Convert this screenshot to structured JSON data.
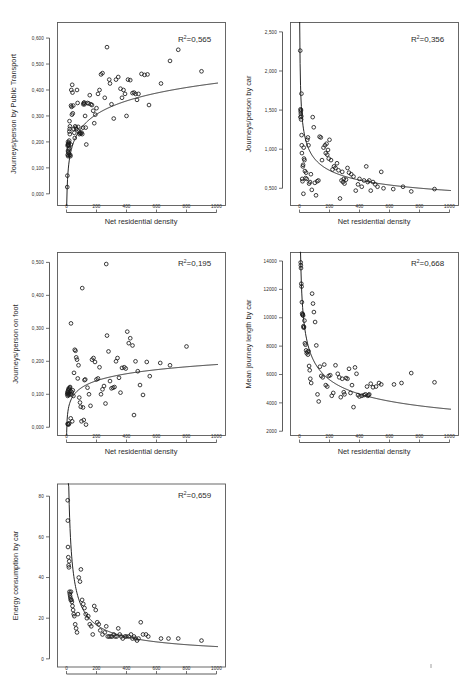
{
  "figure": {
    "background": "#ffffff",
    "marker_color": "#1a1a1a",
    "line_color": "#1a1a1a",
    "frame_color": "#585858",
    "shared_xlabel": "Net residential density",
    "shared_xticks": [
      "0",
      "200",
      "400",
      "600",
      "800",
      "1000"
    ],
    "r2_prefix": "R",
    "r2_sup": "2",
    "panel_count": 5
  },
  "chart_data": [
    {
      "id": "public-transport",
      "type": "scatter",
      "title": "",
      "xlabel": "Net residential density",
      "ylabel": "Journeys/person by Public Transport",
      "annotation": "R2=0,565",
      "r2_value": "=0,565",
      "xlim": [
        -60,
        1060
      ],
      "ylim": [
        -0.045,
        0.66
      ],
      "xticks": [
        0,
        200,
        400,
        600,
        800,
        1000
      ],
      "xticklabels": [
        "0",
        "200",
        "400",
        "600",
        "800",
        "1000"
      ],
      "yticks": [
        0.0,
        0.1,
        0.2,
        0.3,
        0.4,
        0.5,
        0.6
      ],
      "yticklabels": [
        "0,000",
        "0,100",
        "0,200",
        "0,300",
        "0,400",
        "0,500",
        "0,600"
      ],
      "grid": false,
      "fit": {
        "form": "logarithmic",
        "a": 0.0745,
        "b": -0.0885,
        "note": "y = a*ln(x) + b"
      },
      "x": [
        5,
        6,
        8,
        8,
        9,
        10,
        10,
        11,
        12,
        12,
        13,
        14,
        15,
        15,
        16,
        17,
        18,
        18,
        19,
        20,
        21,
        22,
        23,
        25,
        26,
        28,
        30,
        32,
        34,
        36,
        38,
        40,
        42,
        45,
        48,
        52,
        55,
        58,
        62,
        66,
        70,
        74,
        78,
        82,
        86,
        90,
        95,
        100,
        105,
        110,
        112,
        115,
        118,
        120,
        124,
        128,
        132,
        140,
        148,
        155,
        162,
        170,
        178,
        185,
        192,
        200,
        210,
        220,
        230,
        240,
        255,
        270,
        285,
        290,
        300,
        315,
        330,
        345,
        360,
        370,
        380,
        390,
        400,
        410,
        425,
        440,
        450,
        460,
        470,
        480,
        500,
        520,
        540,
        550,
        630,
        690,
        745,
        900
      ],
      "y": [
        0.026,
        0.07,
        0.185,
        0.15,
        0.19,
        0.165,
        0.2,
        0.145,
        0.188,
        0.16,
        0.192,
        0.17,
        0.186,
        0.155,
        0.196,
        0.175,
        0.205,
        0.148,
        0.24,
        0.28,
        0.25,
        0.23,
        0.26,
        0.15,
        0.145,
        0.19,
        0.34,
        0.4,
        0.335,
        0.305,
        0.42,
        0.39,
        0.31,
        0.34,
        0.25,
        0.235,
        0.215,
        0.26,
        0.255,
        0.25,
        0.4,
        0.35,
        0.258,
        0.24,
        0.23,
        0.235,
        0.232,
        0.236,
        0.23,
        0.255,
        0.345,
        0.35,
        0.352,
        0.345,
        0.3,
        0.255,
        0.19,
        0.35,
        0.348,
        0.38,
        0.345,
        0.342,
        0.32,
        0.272,
        0.305,
        0.33,
        0.385,
        0.4,
        0.46,
        0.465,
        0.37,
        0.565,
        0.44,
        0.425,
        0.345,
        0.29,
        0.44,
        0.45,
        0.405,
        0.37,
        0.4,
        0.385,
        0.3,
        0.44,
        0.438,
        0.388,
        0.39,
        0.385,
        0.362,
        0.385,
        0.462,
        0.458,
        0.46,
        0.342,
        0.425,
        0.512,
        0.555,
        0.472
      ]
    },
    {
      "id": "car-journeys",
      "type": "scatter",
      "title": "",
      "xlabel": "Net residential density",
      "ylabel": "Journeys/person by car",
      "annotation": "R2=0,356",
      "r2_value": "=0,356",
      "xlim": [
        -60,
        1060
      ],
      "ylim": [
        0.28,
        2.62
      ],
      "xticks": [
        0,
        200,
        400,
        600,
        800,
        1000
      ],
      "xticklabels": [
        "0",
        "200",
        "400",
        "600",
        "800",
        "1000"
      ],
      "yticks": [
        0.5,
        1.0,
        1.5,
        2.0,
        2.5
      ],
      "yticklabels": [
        "0,500",
        "1,000",
        "1,500",
        "2,000",
        "2,500"
      ],
      "grid": false,
      "fit": {
        "form": "power",
        "a": 3.05,
        "b": -0.27,
        "note": "y = a*x^b"
      },
      "x": [
        5,
        6,
        7,
        8,
        9,
        10,
        11,
        12,
        13,
        14,
        15,
        16,
        18,
        20,
        22,
        24,
        26,
        28,
        30,
        33,
        36,
        40,
        44,
        48,
        52,
        56,
        60,
        64,
        70,
        76,
        82,
        88,
        95,
        102,
        110,
        118,
        126,
        134,
        142,
        150,
        160,
        170,
        175,
        180,
        185,
        190,
        195,
        200,
        210,
        220,
        230,
        240,
        250,
        260,
        270,
        280,
        285,
        290,
        295,
        300,
        310,
        320,
        330,
        345,
        360,
        375,
        390,
        400,
        415,
        430,
        445,
        455,
        465,
        475,
        490,
        505,
        520,
        545,
        560,
        625,
        690,
        745,
        900
      ],
      "y": [
        2.26,
        1.41,
        1.51,
        1.48,
        1.45,
        1.5,
        1.38,
        1.42,
        1.71,
        1.18,
        1.05,
        0.95,
        0.62,
        0.59,
        0.78,
        0.8,
        0.43,
        1.02,
        0.88,
        0.86,
        0.72,
        0.63,
        0.7,
        0.62,
        1.12,
        1.15,
        1.05,
        0.56,
        0.58,
        0.68,
        0.48,
        1.41,
        1.28,
        0.57,
        0.41,
        0.59,
        0.6,
        1.16,
        1.15,
        0.86,
        1.02,
        1.05,
        0.95,
        1.07,
        0.93,
        0.99,
        0.88,
        1.12,
        0.86,
        0.74,
        0.78,
        0.76,
        0.82,
        0.73,
        0.37,
        0.6,
        0.71,
        0.58,
        0.62,
        0.56,
        0.61,
        0.76,
        0.7,
        0.68,
        0.65,
        0.47,
        0.55,
        0.62,
        0.52,
        0.6,
        0.78,
        0.58,
        0.6,
        0.47,
        0.58,
        0.55,
        0.52,
        0.71,
        0.5,
        0.49,
        0.52,
        0.46,
        0.49
      ]
    },
    {
      "id": "on-foot",
      "type": "scatter",
      "title": "",
      "xlabel": "Net residential density",
      "ylabel": "Journeys/person on foot",
      "annotation": "R2=0,195",
      "r2_value": "=0,195",
      "xlim": [
        -60,
        1060
      ],
      "ylim": [
        -0.025,
        0.53
      ],
      "xticks": [
        0,
        200,
        400,
        600,
        800,
        1000
      ],
      "xticklabels": [
        "0",
        "200",
        "400",
        "600",
        "800",
        "1000"
      ],
      "yticks": [
        0.0,
        0.1,
        0.2,
        0.3,
        0.4,
        0.5
      ],
      "yticklabels": [
        "0,000",
        "0,100",
        "0,200",
        "0,300",
        "0,400",
        "0,500"
      ],
      "grid": false,
      "fit": {
        "form": "logarithmic",
        "a": 0.0305,
        "b": -0.0205,
        "note": "y = a*ln(x) + b"
      },
      "x": [
        5,
        6,
        7,
        8,
        9,
        10,
        11,
        12,
        13,
        14,
        15,
        16,
        17,
        18,
        20,
        22,
        24,
        26,
        28,
        30,
        32,
        35,
        38,
        42,
        46,
        50,
        55,
        60,
        65,
        70,
        75,
        80,
        85,
        90,
        95,
        100,
        105,
        110,
        115,
        120,
        125,
        130,
        140,
        150,
        160,
        170,
        180,
        190,
        200,
        210,
        220,
        230,
        240,
        250,
        260,
        265,
        270,
        280,
        290,
        300,
        310,
        320,
        330,
        340,
        350,
        360,
        370,
        385,
        395,
        405,
        415,
        425,
        440,
        450,
        460,
        475,
        490,
        510,
        535,
        555,
        625,
        690,
        800
      ],
      "y": [
        0.1,
        0.105,
        0.01,
        0.095,
        0.108,
        0.1,
        0.112,
        0.01,
        0.008,
        0.105,
        0.118,
        0.115,
        0.098,
        0.012,
        0.102,
        0.12,
        0.122,
        0.11,
        0.027,
        0.315,
        0.1,
        0.107,
        0.018,
        0.112,
        0.095,
        0.165,
        0.235,
        0.232,
        0.212,
        0.205,
        0.148,
        0.188,
        0.09,
        0.075,
        0.062,
        0.018,
        0.422,
        0.06,
        0.022,
        0.143,
        0.145,
        0.008,
        0.12,
        0.1,
        0.065,
        0.205,
        0.21,
        0.198,
        0.145,
        0.148,
        0.182,
        0.1,
        0.115,
        0.125,
        0.072,
        0.495,
        0.278,
        0.23,
        0.14,
        0.118,
        0.12,
        0.122,
        0.2,
        0.21,
        0.15,
        0.105,
        0.18,
        0.182,
        0.178,
        0.29,
        0.255,
        0.27,
        0.248,
        0.037,
        0.2,
        0.17,
        0.128,
        0.098,
        0.198,
        0.155,
        0.195,
        0.188,
        0.245
      ]
    },
    {
      "id": "journey-length",
      "type": "scatter",
      "title": "",
      "xlabel": "Net residential density",
      "ylabel": "Mean journey length by car",
      "annotation": "R2=0,668",
      "r2_value": "=0,668",
      "xlim": [
        -60,
        1060
      ],
      "ylim": [
        1700,
        14600
      ],
      "xticks": [
        0,
        200,
        400,
        600,
        800,
        1000
      ],
      "xticklabels": [
        "0",
        "200",
        "400",
        "600",
        "800",
        "1000"
      ],
      "yticks": [
        2000,
        4000,
        6000,
        8000,
        10000,
        12000,
        14000
      ],
      "yticklabels": [
        "2000",
        "4000",
        "6000",
        "8000",
        "10000",
        "12000",
        "14000"
      ],
      "grid": false,
      "fit": {
        "form": "power",
        "a": 25500,
        "b": -0.285,
        "note": "y = a*x^b"
      },
      "x": [
        8,
        9,
        10,
        12,
        14,
        16,
        18,
        20,
        22,
        24,
        26,
        28,
        30,
        33,
        36,
        40,
        44,
        48,
        52,
        56,
        60,
        64,
        68,
        72,
        78,
        84,
        90,
        96,
        104,
        112,
        120,
        128,
        136,
        145,
        155,
        165,
        175,
        185,
        195,
        205,
        215,
        225,
        240,
        255,
        265,
        275,
        285,
        295,
        300,
        310,
        320,
        330,
        340,
        350,
        360,
        370,
        380,
        390,
        400,
        415,
        430,
        440,
        450,
        455,
        460,
        465,
        475,
        490,
        510,
        530,
        545,
        630,
        680,
        745,
        900
      ],
      "y": [
        13900,
        13700,
        13500,
        12400,
        12200,
        11100,
        10300,
        10200,
        10250,
        10150,
        9400,
        9300,
        9350,
        9800,
        8200,
        8100,
        7700,
        7500,
        7600,
        7400,
        7650,
        6600,
        6300,
        5700,
        5400,
        11700,
        11000,
        10400,
        9700,
        8050,
        4600,
        4100,
        6550,
        5900,
        5800,
        6700,
        5250,
        5150,
        5900,
        5950,
        4500,
        4700,
        6650,
        6050,
        5800,
        4400,
        5700,
        4750,
        4600,
        5750,
        5700,
        6400,
        4700,
        5250,
        3700,
        6500,
        6050,
        4550,
        4450,
        4500,
        4550,
        4600,
        5150,
        4500,
        4550,
        4600,
        5350,
        5100,
        5150,
        5400,
        5300,
        5300,
        5400,
        6100,
        5450
      ]
    },
    {
      "id": "energy-consumption",
      "type": "scatter",
      "title": "",
      "xlabel": "Net residential density",
      "ylabel": "Energy consumption by car",
      "annotation": "R2=0,659",
      "r2_value": "=0,659",
      "xlim": [
        -60,
        1060
      ],
      "ylim": [
        -4,
        86
      ],
      "xticks": [
        0,
        200,
        400,
        600,
        800,
        1000
      ],
      "xticklabels": [
        "0",
        "200",
        "400",
        "600",
        "800",
        "1000"
      ],
      "yticks": [
        0,
        20,
        40,
        60,
        80
      ],
      "yticklabels": [
        "0",
        "20",
        "40",
        "60",
        "80"
      ],
      "grid": false,
      "fit": {
        "form": "power",
        "a": 470,
        "b": -0.63,
        "note": "y = a*x^b"
      },
      "x": [
        8,
        9,
        10,
        12,
        14,
        16,
        18,
        20,
        22,
        24,
        26,
        28,
        30,
        33,
        36,
        40,
        44,
        48,
        52,
        58,
        64,
        70,
        76,
        82,
        90,
        96,
        104,
        112,
        120,
        128,
        136,
        145,
        155,
        165,
        175,
        185,
        195,
        205,
        215,
        225,
        240,
        255,
        265,
        275,
        285,
        295,
        305,
        315,
        325,
        335,
        345,
        355,
        365,
        375,
        390,
        400,
        415,
        430,
        440,
        450,
        460,
        470,
        480,
        495,
        510,
        530,
        545,
        630,
        680,
        745,
        900
      ],
      "y": [
        78,
        68,
        55,
        50,
        46,
        45,
        48,
        33,
        32,
        31,
        30,
        29,
        33,
        29,
        28,
        26,
        24,
        22,
        21,
        17,
        15,
        13,
        22,
        40,
        38,
        44,
        29,
        27,
        25,
        22,
        20,
        21,
        17,
        16,
        12,
        26,
        24,
        18,
        17,
        14,
        12,
        13,
        16,
        11,
        11,
        11,
        11,
        12,
        11,
        11,
        15,
        12,
        11,
        10,
        11,
        11,
        11,
        12,
        10,
        11,
        10,
        9,
        10,
        18,
        12,
        12,
        11,
        10,
        10,
        10,
        9
      ]
    }
  ]
}
